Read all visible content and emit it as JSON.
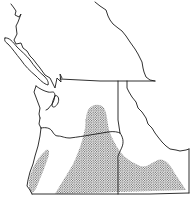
{
  "map": {
    "type": "species range map",
    "region": "Pacific Northwest",
    "style": "black line outline with stippled range",
    "colors": {
      "background": "#ffffff",
      "border": "#1a1a1a",
      "stipple": "#333333"
    },
    "regions_depicted": [
      "British Columbia (southern)",
      "Washington",
      "Oregon",
      "Idaho",
      "Vancouver Island"
    ],
    "range_areas": [
      "south-central Oregon / eastern Oregon stippled area",
      "southwest Oregon coastal stippled strip",
      "south-central Washington stippled patch",
      "southern Idaho (Snake River Plain) stippled area"
    ]
  }
}
